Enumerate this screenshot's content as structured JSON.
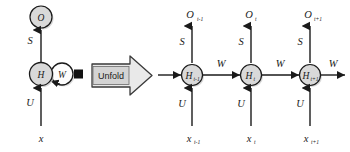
{
  "figure": {
    "background_color": "#ffffff",
    "stroke_color": "#1a1a1a",
    "node_fill": "#d9d9d9",
    "node_fill_white": "#fdfdfd",
    "shadow_color": "#bdbdbd",
    "unfold_button_fill": "#d4d4d4"
  },
  "folded": {
    "output_node": {
      "label": "O"
    },
    "hidden_node": {
      "label": "H"
    },
    "recurrent_node": {
      "label": "W"
    },
    "input_label": "x",
    "edge_input_weight": "U",
    "edge_output_weight": "S",
    "delay_marker": "square-delay-marker"
  },
  "transition": {
    "label": "Unfold",
    "arrow": "right-arrow"
  },
  "unfolded": {
    "incoming_weight": "W",
    "outgoing_weight": "W",
    "steps": [
      {
        "output_base": "O",
        "output_sub": "t-1",
        "hidden_base": "H",
        "hidden_sub": "t-1",
        "input_base": "x",
        "input_sub": "t-1",
        "edge_output_weight": "S",
        "edge_input_weight": "U",
        "edge_recurrent_weight": "W"
      },
      {
        "output_base": "O",
        "output_sub": "t",
        "hidden_base": "H",
        "hidden_sub": "t",
        "input_base": "x",
        "input_sub": "t",
        "edge_output_weight": "S",
        "edge_input_weight": "U",
        "edge_recurrent_weight": "W"
      },
      {
        "output_base": "O",
        "output_sub": "t+1",
        "hidden_base": "H",
        "hidden_sub": "t+1",
        "input_base": "x",
        "input_sub": "t+1",
        "edge_output_weight": "S",
        "edge_input_weight": "U",
        "edge_recurrent_weight": "W"
      }
    ]
  }
}
